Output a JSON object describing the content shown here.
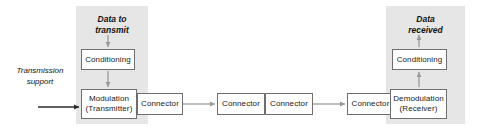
{
  "diagram": {
    "colors": {
      "panel_fill": "#e6e6e6",
      "box_border": "#6e6e6e",
      "box_fill": "#ffffff",
      "arrow_grey": "#9a9a9a",
      "arrow_dark": "#2b2b2b",
      "text": "#111111",
      "background": "#ffffff"
    },
    "groups": {
      "transmitter_panel_label": "Transmitter side",
      "receiver_panel_label": "Receiver side"
    },
    "labels": {
      "data_to_transmit": "Data to\ntransmit",
      "data_to_transmit_line1": "Data to",
      "data_to_transmit_line2": "transmit",
      "data_received": "Data\nreceived",
      "data_received_line1": "Data",
      "data_received_line2": "received",
      "transmission_support_line1": "Transmission",
      "transmission_support_line2": "support"
    },
    "blocks": [
      {
        "id": "conditioning-tx",
        "line1": "Conditioning",
        "line2": ""
      },
      {
        "id": "modulation",
        "line1": "Modulation",
        "line2": "(Transmitter)"
      },
      {
        "id": "connector-1",
        "line1": "Connector",
        "line2": ""
      },
      {
        "id": "connector-2",
        "line1": "Connector",
        "line2": ""
      },
      {
        "id": "connector-3",
        "line1": "Connector",
        "line2": ""
      },
      {
        "id": "connector-4",
        "line1": "Connector",
        "line2": ""
      },
      {
        "id": "demodulation",
        "line1": "Demodulation",
        "line2": "(Receiver)"
      },
      {
        "id": "conditioning-rx",
        "line1": "Conditioning",
        "line2": ""
      }
    ],
    "flow": {
      "arrow_data_to_conditioning_tx": "down",
      "arrow_conditioning_tx_to_modulation": "down",
      "arrow_transmission_support_to_modulation": "right",
      "arrow_connector1_to_connector2": "right",
      "arrow_connector3_to_connector4": "right",
      "arrow_demodulation_to_conditioning_rx": "up",
      "arrow_conditioning_rx_to_data_received": "up"
    }
  }
}
